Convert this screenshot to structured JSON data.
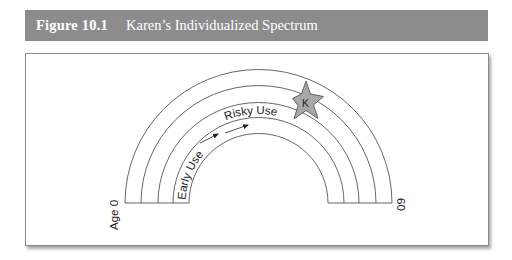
{
  "figure": {
    "number": "Figure 10.1",
    "title": "Karen’s Individualized Spectrum"
  },
  "diagram": {
    "type": "rainbow-spectrum",
    "bands": 4,
    "start_label": "Age 0",
    "end_label": "60",
    "inner_band_label": "Early Use",
    "second_band_label": "Risky Use",
    "marker": {
      "shape": "star",
      "label": "K",
      "fill": "#a8a8a8",
      "stroke": "#555555"
    },
    "arrows": 2,
    "colors": {
      "header_bg": "#8c8c8c",
      "header_text": "#ffffff",
      "line": "#555555"
    }
  }
}
